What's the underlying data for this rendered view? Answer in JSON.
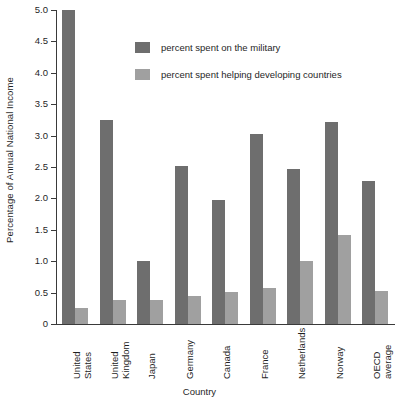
{
  "chart_data": {
    "type": "bar",
    "title": "",
    "xlabel": "Country",
    "ylabel": "Percentage of Annual National Income",
    "ylim": [
      0,
      5.0
    ],
    "ytick_step": 0.5,
    "yticks": [
      "0",
      "0.5",
      "1.0",
      "1.5",
      "2.0",
      "2.5",
      "3.0",
      "3.5",
      "4.0",
      "4.5",
      "5.0"
    ],
    "grid": false,
    "legend_position": "top-center",
    "categories": [
      "United States",
      "United Kingdom",
      "Japan",
      "Germany",
      "Canada",
      "France",
      "Netherlands",
      "Norway",
      "OECD average"
    ],
    "category_lines": [
      [
        "United",
        "States"
      ],
      [
        "United",
        "Kingdom"
      ],
      [
        "Japan"
      ],
      [
        "Germany"
      ],
      [
        "Canada"
      ],
      [
        "France"
      ],
      [
        "Netherlands"
      ],
      [
        "Norway"
      ],
      [
        "OECD",
        "average"
      ]
    ],
    "series": [
      {
        "name": "percent spent on the military",
        "color": "#6e6e6e",
        "values": [
          5.0,
          3.25,
          1.0,
          2.52,
          1.98,
          3.02,
          2.47,
          3.22,
          2.28
        ]
      },
      {
        "name": "percent spent helping developing countries",
        "color": "#a0a0a0",
        "values": [
          0.25,
          0.38,
          0.38,
          0.45,
          0.51,
          0.57,
          1.0,
          1.42,
          0.53
        ]
      }
    ]
  },
  "axes": {
    "y_title": "Percentage of Annual National Income",
    "x_title": "Country"
  },
  "legend": {
    "items": [
      {
        "label": "percent spent on the military",
        "color": "#6e6e6e"
      },
      {
        "label": "percent spent helping developing countries",
        "color": "#a0a0a0"
      }
    ]
  }
}
